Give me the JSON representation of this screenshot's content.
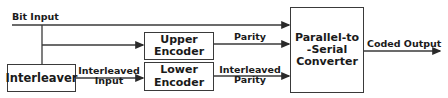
{
  "diagram": {
    "blocks": {
      "interleaver": {
        "label": "Interleaver"
      },
      "upper_encoder": {
        "line1": "Upper",
        "line2": "Encoder"
      },
      "lower_encoder": {
        "line1": "Lower",
        "line2": "Encoder"
      },
      "converter": {
        "line1": "Parallel-to",
        "line2": "-Serial",
        "line3": "Converter"
      }
    },
    "signals": {
      "bit_input": "Bit Input",
      "parity": "Parity",
      "interleaved_input_1": "Interleaved",
      "interleaved_input_2": "Input",
      "interleaved_parity_1": "Interleaved",
      "interleaved_parity_2": "Parity",
      "coded_output": "Coded Output"
    },
    "colors": {
      "line": "#3a3a3a",
      "background": "#ffffff"
    }
  }
}
